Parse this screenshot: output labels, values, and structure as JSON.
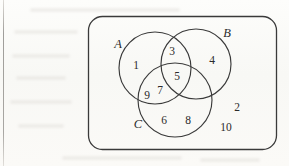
{
  "figure": {
    "type": "venn-diagram",
    "sets": 3,
    "universal_set_shape": "rounded-rectangle",
    "stroke_color": "#3a3a3a",
    "text_color": "#2b2b2b",
    "background_color": "#fbfbf9"
  },
  "set_labels": {
    "a": "A",
    "b": "B",
    "c": "C"
  },
  "regions": {
    "a_only": "1",
    "b_only": "4",
    "c_only_left": "6",
    "c_only_right": "8",
    "a_and_b": "3",
    "a_and_b_and_c": "5",
    "a_and_c_left": "9",
    "a_and_c_right": "7",
    "outside_upper": "2",
    "outside_lower": "10"
  }
}
